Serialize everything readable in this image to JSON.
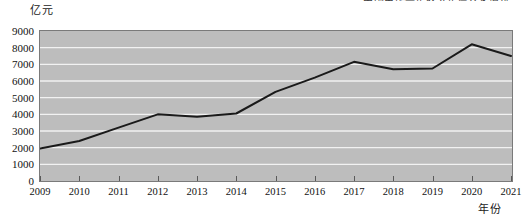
{
  "caption_top": "中国电影票房收入年度变化情况",
  "axis": {
    "unit_label": "亿元",
    "x_title": "年份"
  },
  "chart_data": {
    "type": "line",
    "title": "",
    "xlabel": "年份",
    "ylabel": "亿元",
    "ylim": [
      0,
      9000
    ],
    "ytick_step": 1000,
    "grid": true,
    "legend": "none",
    "line_color": "#1a1a1a",
    "plot_background": "#bdbdbd",
    "gridline_color": "#f2f2f2",
    "categories": [
      "2009",
      "2010",
      "2011",
      "2012",
      "2013",
      "2014",
      "2015",
      "2016",
      "2017",
      "2018",
      "2019",
      "2020",
      "2021"
    ],
    "values": [
      1950,
      2400,
      3200,
      4000,
      3850,
      4050,
      5350,
      6200,
      7150,
      6700,
      6750,
      8200,
      7500
    ],
    "yticks": [
      "0",
      "1000",
      "2000",
      "3000",
      "4000",
      "5000",
      "6000",
      "7000",
      "8000",
      "9000"
    ]
  }
}
